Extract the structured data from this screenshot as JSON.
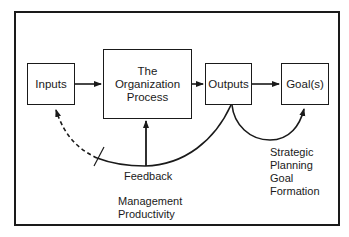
{
  "diagram": {
    "nodes": {
      "inputs": "Inputs",
      "process_line1": "The",
      "process_line2": "Organization",
      "process_line3": "Process",
      "outputs": "Outputs",
      "goals": "Goal(s)"
    },
    "labels": {
      "feedback": "Feedback",
      "management_line1": "Management",
      "management_line2": "Productivity",
      "strategic_line1": "Strategic",
      "strategic_line2": "Planning",
      "strategic_line3": "Goal",
      "strategic_line4": "Formation"
    },
    "edges": [
      {
        "from": "Inputs",
        "to": "The Organization Process",
        "style": "solid"
      },
      {
        "from": "The Organization Process",
        "to": "Outputs",
        "style": "solid"
      },
      {
        "from": "Outputs",
        "to": "Goal(s)",
        "style": "solid"
      },
      {
        "from": "Outputs",
        "to": "Inputs",
        "style": "feedback curve, dashed near Inputs, blocked"
      },
      {
        "from": "Feedback",
        "to": "The Organization Process",
        "style": "solid"
      },
      {
        "from": "Outputs",
        "to": "Goal(s)",
        "style": "curved loop"
      }
    ]
  }
}
